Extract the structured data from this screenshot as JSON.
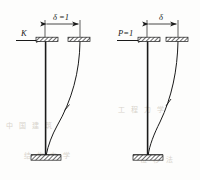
{
  "figure": {
    "background_color": "#fdfdfc",
    "line_color": "#1a1a1a",
    "hatch_color": "#2b2b2b",
    "watermark_color": "#d8d4cc",
    "panels": [
      {
        "id": "left",
        "name": "unit-displacement-panel",
        "dimension_label": "δ =1",
        "load_label": "K",
        "load_type": "reaction-force",
        "support_top": "slider-support",
        "support_bottom": "fixed-support",
        "deflection": "deflected-column-curve"
      },
      {
        "id": "right",
        "name": "unit-force-panel",
        "dimension_label": "δ",
        "load_label": "P=1",
        "load_type": "applied-unit-load",
        "support_top": "slider-support",
        "support_bottom": "fixed-support",
        "deflection": "deflected-column-curve"
      }
    ],
    "watermarks": [
      {
        "text": "中 国 建 筑",
        "x": 6,
        "y": 128
      },
      {
        "text": "工 程 力 学",
        "x": 118,
        "y": 112
      },
      {
        "text": "结 构 力 学",
        "x": 24,
        "y": 158
      },
      {
        "text": "位 移 法",
        "x": 140,
        "y": 162
      }
    ]
  }
}
